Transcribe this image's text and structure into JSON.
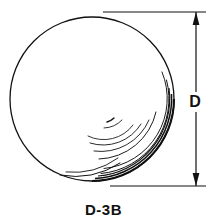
{
  "drawing": {
    "title": "Sphere diameter technical drawing",
    "figure_caption": "D-3B",
    "background_color": "#ffffff",
    "line_color": "#111111",
    "subject": {
      "name": "ball-sphere",
      "shape": "circle",
      "center_x": 92,
      "center_y": 99,
      "radius": 82,
      "stroke_width": 1.2
    },
    "shading": {
      "description": "concentric highlight arcs on lower-right of sphere",
      "arc_count": 9
    },
    "dimension": {
      "label": "D",
      "label_x": 195,
      "label_y": 106,
      "line_x": 196,
      "top_y": 12,
      "bottom_y": 186,
      "arrowheads": [
        "top",
        "bottom"
      ],
      "extension_lines": [
        {
          "name": "top-extension-line",
          "x1": 103,
          "y1": 12,
          "x2": 206,
          "y2": 12
        },
        {
          "name": "bottom-extension-line",
          "x1": 110,
          "y1": 186,
          "x2": 206,
          "y2": 186
        }
      ]
    }
  }
}
